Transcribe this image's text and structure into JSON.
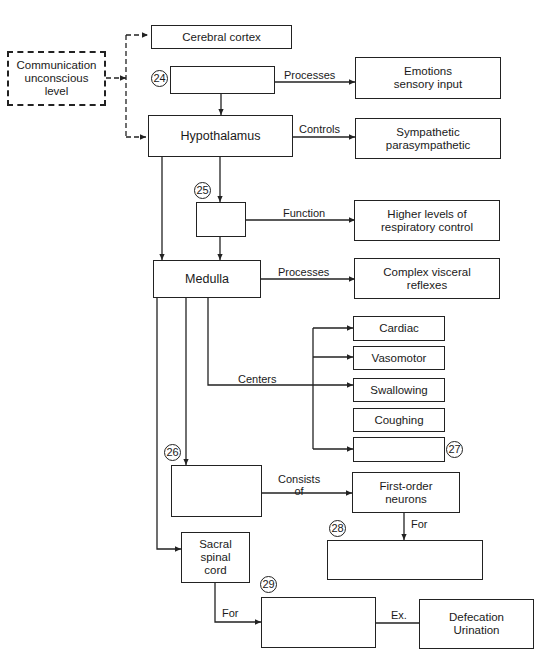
{
  "diagram": {
    "nodes": {
      "communication": "Communication\nunconscious\nlevel",
      "cerebral_cortex": "Cerebral cortex",
      "blank_24": "",
      "emotions": "Emotions\nsensory input",
      "hypothalamus": "Hypothalamus",
      "sympathetic": "Sympathetic\nparasympathetic",
      "blank_25": "",
      "higher_levels": "Higher levels of\nrespiratory control",
      "medulla": "Medulla",
      "complex_visceral": "Complex visceral\nreflexes",
      "cardiac": "Cardiac",
      "vasomotor": "Vasomotor",
      "swallowing": "Swallowing",
      "coughing": "Coughing",
      "blank_27": "",
      "blank_26": "",
      "first_order": "First-order\nneurons",
      "blank_28": "",
      "sacral": "Sacral\nspinal\ncord",
      "blank_29": "",
      "defecation": "Defecation\nUrination"
    },
    "edge_labels": {
      "processes_1": "Processes",
      "controls": "Controls",
      "function": "Function",
      "processes_2": "Processes",
      "centers": "Centers",
      "consists_of": "Consists\nof",
      "for_1": "For",
      "for_2": "For",
      "ex": "Ex."
    },
    "numbers": {
      "n24": "24",
      "n25": "25",
      "n26": "26",
      "n27": "27",
      "n28": "28",
      "n29": "29"
    }
  }
}
